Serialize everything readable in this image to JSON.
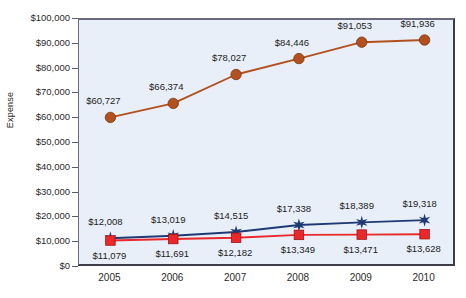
{
  "chart_data": {
    "type": "line",
    "title": "",
    "xlabel": "",
    "ylabel": "Expense",
    "categories": [
      "2005",
      "2006",
      "2007",
      "2008",
      "2009",
      "2010"
    ],
    "ylim": [
      0,
      100000
    ],
    "ytick_labels": [
      "$100,000",
      "$90,000",
      "$80,000",
      "$70,000",
      "$60,000",
      "$50,000",
      "$40,000",
      "$30,000",
      "$20,000",
      "$10,000",
      "$0"
    ],
    "ytick_values": [
      100000,
      90000,
      80000,
      70000,
      60000,
      50000,
      40000,
      30000,
      20000,
      10000,
      0
    ],
    "grid": false,
    "legend": "none",
    "plot_background": "#e9eff8",
    "series": [
      {
        "name": "series-brown",
        "color": "#b2501e",
        "marker": "circle",
        "values": [
          60727,
          66374,
          78027,
          84446,
          91053,
          91936
        ],
        "labels": [
          "$60,727",
          "$66,374",
          "$78,027",
          "$84,446",
          "$91,053",
          "$91,936"
        ]
      },
      {
        "name": "series-blue",
        "color": "#1f3a72",
        "marker": "star",
        "values": [
          12008,
          13019,
          14515,
          17338,
          18389,
          19318
        ],
        "labels": [
          "$12,008",
          "$13,019",
          "$14,515",
          "$17,338",
          "$18,389",
          "$19,318"
        ]
      },
      {
        "name": "series-red",
        "color": "#e8282a",
        "marker": "square",
        "values": [
          11079,
          11691,
          12182,
          13349,
          13471,
          13628
        ],
        "labels": [
          "$11,079",
          "$11,691",
          "$12,182",
          "$13,349",
          "$13,471",
          "$13,628"
        ]
      }
    ]
  }
}
